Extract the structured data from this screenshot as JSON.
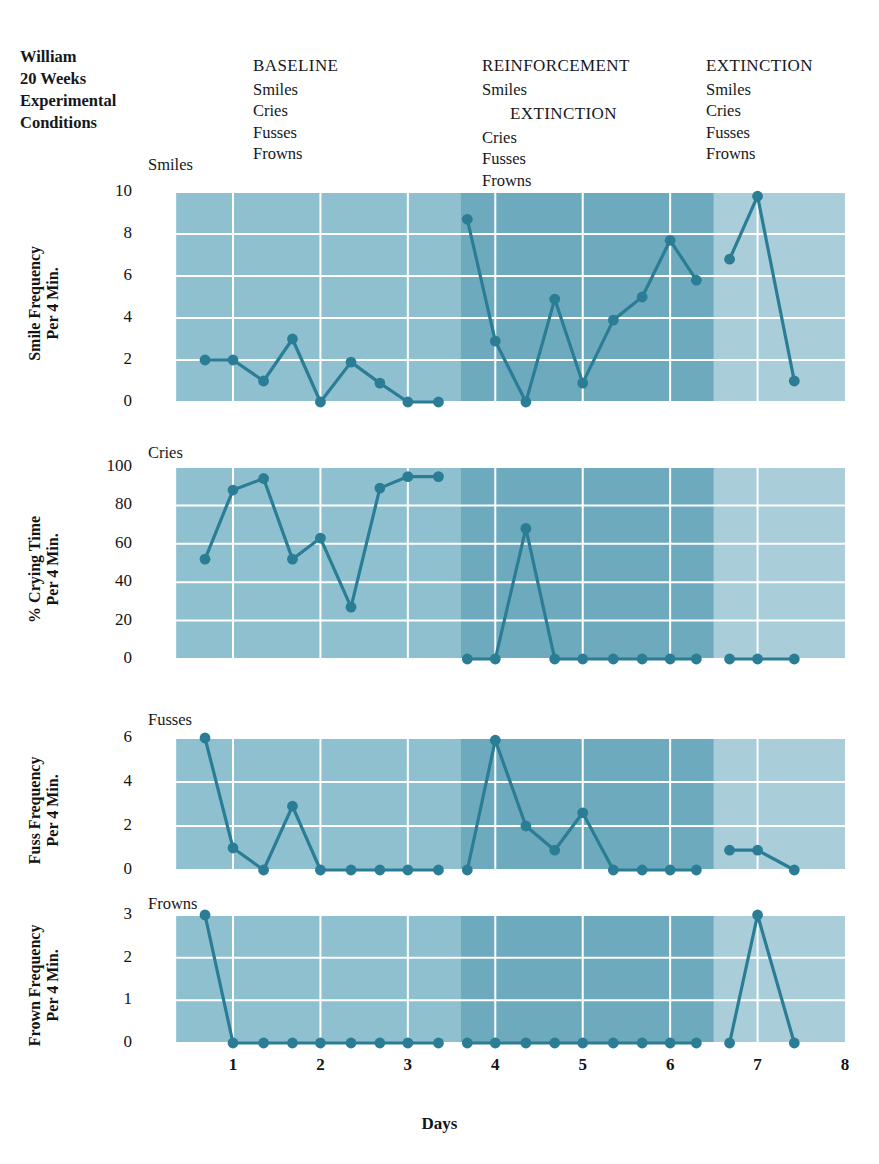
{
  "subject": {
    "line1": "William",
    "line2": "20 Weeks",
    "line3": "Experimental",
    "line4": "Conditions"
  },
  "phases": [
    {
      "id": "baseline",
      "heading": "BASELINE",
      "items_text": "Smiles\nCries\nFusses\nFrowns",
      "items": [
        "Smiles",
        "Cries",
        "Fusses",
        "Frowns"
      ],
      "band_color": "#8ec0d0",
      "x_start": 0.35,
      "x_end": 3.6
    },
    {
      "id": "reinforcement",
      "heading": "REINFORCEMENT",
      "sub_first": "Smiles",
      "sub_heading": "EXTINCTION",
      "items_text": "Cries\nFusses\nFrowns",
      "items": [
        "Cries",
        "Fusses",
        "Frowns"
      ],
      "band_color": "#6daabd",
      "x_start": 3.6,
      "x_end": 6.5
    },
    {
      "id": "extinction",
      "heading": "EXTINCTION",
      "items_text": "Smiles\nCries\nFusses\nFrowns",
      "items": [
        "Smiles",
        "Cries",
        "Fusses",
        "Frowns"
      ],
      "band_color": "#a9cdd9",
      "x_start": 6.5,
      "x_end": 8.0
    }
  ],
  "axis": {
    "x_title": "Days",
    "x_ticks": [
      1,
      2,
      3,
      4,
      5,
      6,
      7,
      8
    ],
    "x_min": 0,
    "x_max": 8
  },
  "colors": {
    "line": "#2b7d96",
    "marker": "#2b7d96",
    "grid": "#ffffff",
    "text": "#141414",
    "background": "#ffffff"
  },
  "chart_data": [
    {
      "type": "line",
      "id": "smiles",
      "title": "Smiles",
      "ylabel": "Smile Frequency\nPer 4 Min.",
      "ylabel_lines": [
        "Smile Frequency",
        "Per 4 Min."
      ],
      "xlabel": "Days",
      "ylim": [
        0,
        10
      ],
      "yticks": [
        0,
        2,
        4,
        6,
        8,
        10
      ],
      "xlim": [
        0,
        8
      ],
      "grid": true,
      "x": [
        0.68,
        1.0,
        1.35,
        1.68,
        2.0,
        2.35,
        2.68,
        3.0,
        3.35,
        3.68,
        4.0,
        4.35,
        4.68,
        5.0,
        5.35,
        5.68,
        6.0,
        6.3,
        6.68,
        7.0,
        7.42
      ],
      "values": [
        2,
        2,
        1,
        3,
        0,
        1.9,
        0.9,
        0,
        0,
        8.7,
        2.9,
        0,
        4.9,
        0.9,
        3.9,
        5,
        7.7,
        5.8,
        6.8,
        9.8,
        1
      ],
      "segments": [
        {
          "phase": "baseline",
          "x": [
            0.68,
            1.0,
            1.35,
            1.68,
            2.0,
            2.35,
            2.68,
            3.0,
            3.35
          ],
          "values": [
            2,
            2,
            1,
            3,
            0,
            1.9,
            0.9,
            0,
            0
          ]
        },
        {
          "phase": "reinforcement",
          "x": [
            3.68,
            4.0,
            4.35,
            4.68,
            5.0,
            5.35,
            5.68,
            6.0,
            6.3
          ],
          "values": [
            8.7,
            2.9,
            0,
            4.9,
            0.9,
            3.9,
            5,
            7.7,
            5.8
          ]
        },
        {
          "phase": "extinction",
          "x": [
            6.68,
            7.0,
            7.42
          ],
          "values": [
            6.8,
            9.8,
            1
          ]
        }
      ]
    },
    {
      "type": "line",
      "id": "cries",
      "title": "Cries",
      "ylabel": "% Crying Time\nPer 4 Min.",
      "ylabel_lines": [
        "% Crying Time",
        "Per 4 Min."
      ],
      "xlabel": "Days",
      "ylim": [
        0,
        100
      ],
      "yticks": [
        0,
        20,
        40,
        60,
        80,
        100
      ],
      "xlim": [
        0,
        8
      ],
      "grid": true,
      "x": [
        0.68,
        1.0,
        1.35,
        1.68,
        2.0,
        2.35,
        2.68,
        3.0,
        3.35,
        3.68,
        4.0,
        4.35,
        4.68,
        5.0,
        5.35,
        5.68,
        6.0,
        6.3,
        6.68,
        7.0,
        7.42
      ],
      "values": [
        52,
        88,
        94,
        52,
        63,
        27,
        89,
        95,
        95,
        0,
        0,
        68,
        0,
        0,
        0,
        0,
        0,
        0,
        0,
        0,
        0
      ],
      "segments": [
        {
          "phase": "baseline",
          "x": [
            0.68,
            1.0,
            1.35,
            1.68,
            2.0,
            2.35,
            2.68,
            3.0,
            3.35
          ],
          "values": [
            52,
            88,
            94,
            52,
            63,
            27,
            89,
            95,
            95
          ]
        },
        {
          "phase": "reinforcement",
          "x": [
            3.68,
            4.0,
            4.35,
            4.68,
            5.0,
            5.35,
            5.68,
            6.0,
            6.3
          ],
          "values": [
            0,
            0,
            68,
            0,
            0,
            0,
            0,
            0,
            0
          ]
        },
        {
          "phase": "extinction",
          "x": [
            6.68,
            7.0,
            7.42
          ],
          "values": [
            0,
            0,
            0
          ]
        }
      ]
    },
    {
      "type": "line",
      "id": "fusses",
      "title": "Fusses",
      "ylabel": "Fuss Frequency\nPer 4 Min.",
      "ylabel_lines": [
        "Fuss Frequency",
        "Per 4 Min."
      ],
      "xlabel": "Days",
      "ylim": [
        0,
        6
      ],
      "yticks": [
        0,
        2,
        4,
        6
      ],
      "xlim": [
        0,
        8
      ],
      "grid": true,
      "x": [
        0.68,
        1.0,
        1.35,
        1.68,
        2.0,
        2.35,
        2.68,
        3.0,
        3.35,
        3.68,
        4.0,
        4.35,
        4.68,
        5.0,
        5.35,
        5.68,
        6.0,
        6.3,
        6.68,
        7.0,
        7.42
      ],
      "values": [
        6,
        1,
        0,
        2.9,
        0,
        0,
        0,
        0,
        0,
        0,
        5.9,
        2,
        0.9,
        2.6,
        0,
        0,
        0,
        0,
        0.9,
        0.9,
        0
      ],
      "segments": [
        {
          "phase": "baseline",
          "x": [
            0.68,
            1.0,
            1.35,
            1.68,
            2.0,
            2.35,
            2.68,
            3.0,
            3.35
          ],
          "values": [
            6,
            1,
            0,
            2.9,
            0,
            0,
            0,
            0,
            0
          ]
        },
        {
          "phase": "reinforcement",
          "x": [
            3.68,
            4.0,
            4.35,
            4.68,
            5.0,
            5.35,
            5.68,
            6.0,
            6.3
          ],
          "values": [
            0,
            5.9,
            2,
            0.9,
            2.6,
            0,
            0,
            0,
            0
          ]
        },
        {
          "phase": "extinction",
          "x": [
            6.68,
            7.0,
            7.42
          ],
          "values": [
            0.9,
            0.9,
            0
          ]
        }
      ]
    },
    {
      "type": "line",
      "id": "frowns",
      "title": "Frowns",
      "ylabel": "Frown Frequency\nPer 4 Min.",
      "ylabel_lines": [
        "Frown Frequency",
        "Per 4 Min."
      ],
      "xlabel": "Days",
      "ylim": [
        0,
        3
      ],
      "yticks": [
        0,
        1,
        2,
        3
      ],
      "xlim": [
        0,
        8
      ],
      "grid": true,
      "x": [
        0.68,
        1.0,
        1.35,
        1.68,
        2.0,
        2.35,
        2.68,
        3.0,
        3.35,
        3.68,
        4.0,
        4.35,
        4.68,
        5.0,
        5.35,
        5.68,
        6.0,
        6.3,
        6.68,
        7.0,
        7.42
      ],
      "values": [
        3,
        0,
        0,
        0,
        0,
        0,
        0,
        0,
        0,
        0,
        0,
        0,
        0,
        0,
        0,
        0,
        0,
        0,
        0,
        3,
        0
      ],
      "segments": [
        {
          "phase": "baseline",
          "x": [
            0.68,
            1.0,
            1.35,
            1.68,
            2.0,
            2.35,
            2.68,
            3.0,
            3.35
          ],
          "values": [
            3,
            0,
            0,
            0,
            0,
            0,
            0,
            0,
            0
          ]
        },
        {
          "phase": "reinforcement",
          "x": [
            3.68,
            4.0,
            4.35,
            4.68,
            5.0,
            5.35,
            5.68,
            6.0,
            6.3
          ],
          "values": [
            0,
            0,
            0,
            0,
            0,
            0,
            0,
            0,
            0
          ]
        },
        {
          "phase": "extinction",
          "x": [
            6.68,
            7.0,
            7.42
          ],
          "values": [
            0,
            3,
            0
          ]
        }
      ]
    }
  ]
}
